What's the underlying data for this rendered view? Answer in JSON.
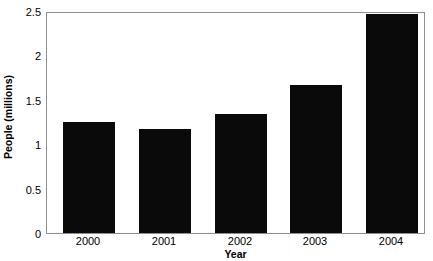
{
  "chart_data": {
    "type": "bar",
    "title": "",
    "categories": [
      "2000",
      "2001",
      "2002",
      "2003",
      "2004"
    ],
    "values": [
      1.25,
      1.17,
      1.34,
      1.67,
      2.47
    ],
    "series": [
      {
        "name": "People (millions)",
        "values": [
          1.25,
          1.17,
          1.34,
          1.67,
          2.47
        ]
      }
    ],
    "xlabel": "Year",
    "ylabel": "People (millions)",
    "ylim": [
      0,
      2.5
    ],
    "yticks": [
      "0",
      "0.5",
      "1",
      "1.5",
      "2",
      "2.5"
    ],
    "ytick_values": [
      0,
      0.5,
      1,
      1.5,
      2,
      2.5
    ],
    "xtick_labels": [
      "2000",
      "2001",
      "2002",
      "2003",
      "2004"
    ],
    "grid": false,
    "legend": false,
    "bar_color": "#0a0a0a",
    "plot_border_color": "#8f8f8f",
    "background_color": "#ffffff"
  }
}
